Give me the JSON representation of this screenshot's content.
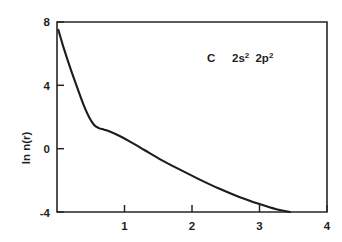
{
  "chart_data": {
    "type": "line",
    "title": "",
    "subtitle": "",
    "xlabel": "",
    "ylabel": "ln n(r)",
    "xlim": [
      0,
      4
    ],
    "ylim": [
      -4,
      8
    ],
    "grid": false,
    "legend_position": "none",
    "x_ticks": [
      1,
      2,
      3,
      4
    ],
    "x_tick_labels": [
      "1",
      "2",
      "3",
      "4"
    ],
    "y_ticks": [
      8,
      4,
      0,
      -4
    ],
    "y_tick_labels": [
      "8",
      "4",
      "0",
      "-4"
    ],
    "annotations": [
      {
        "name": "element-configuration",
        "element": "C",
        "config_terms": [
          {
            "shell": "2s",
            "exponent": "2"
          },
          {
            "shell": "2p",
            "exponent": "2"
          }
        ],
        "text": "C   2s2 2p2",
        "x": 2.1,
        "y": 6.2
      }
    ],
    "series": [
      {
        "name": "ln n(r)",
        "color": "#1c1c1c",
        "x": [
          0.02,
          0.1,
          0.2,
          0.3,
          0.4,
          0.48,
          0.55,
          0.62,
          0.7,
          0.8,
          0.95,
          1.1,
          1.3,
          1.55,
          1.8,
          2.1,
          2.4,
          2.7,
          3.0,
          3.25,
          3.45
        ],
        "y": [
          7.5,
          6.35,
          5.05,
          3.85,
          2.7,
          1.95,
          1.5,
          1.3,
          1.2,
          1.05,
          0.75,
          0.4,
          -0.1,
          -0.72,
          -1.28,
          -1.92,
          -2.52,
          -3.05,
          -3.5,
          -3.83,
          -4.0
        ]
      }
    ]
  },
  "figure": {
    "caption": "",
    "axis_label_y": "ln n(r)"
  }
}
